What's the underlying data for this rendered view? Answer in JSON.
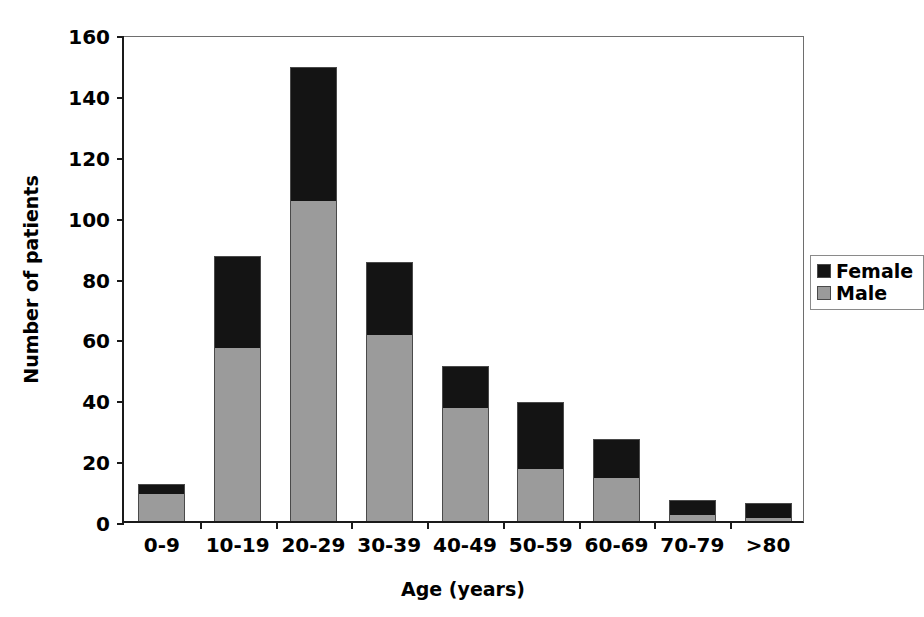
{
  "chart_data": {
    "type": "bar",
    "subtype": "stacked-vertical",
    "title": "",
    "xlabel": "Age (years)",
    "ylabel": "Number of patients",
    "categories": [
      "0-9",
      "10-19",
      "20-29",
      "30-39",
      "40-49",
      "50-59",
      "60-69",
      "70-79",
      ">80"
    ],
    "series": [
      {
        "name": "Male",
        "color": "#9b9b9b",
        "values": [
          9,
          57,
          105,
          61,
          37,
          17,
          14,
          2,
          1
        ]
      },
      {
        "name": "Female",
        "color": "#141414",
        "values": [
          3,
          30,
          44,
          24,
          14,
          22,
          13,
          5,
          5
        ]
      }
    ],
    "totals": [
      12,
      87,
      149,
      85,
      51,
      39,
      27,
      7,
      6
    ],
    "ylim": [
      0,
      160
    ],
    "yticks": [
      0,
      20,
      40,
      60,
      80,
      100,
      120,
      140,
      160
    ],
    "ytick_labels": [
      "0",
      "20",
      "40",
      "60",
      "80",
      "100",
      "120",
      "140",
      "160"
    ],
    "grid": false,
    "legend_position": "inside-upper-right",
    "legend_entries": [
      "Female",
      "Male"
    ]
  },
  "axes": {
    "y_title": "Number of patients",
    "x_title": "Age (years)"
  },
  "legend": {
    "female_label": "Female",
    "male_label": "Male"
  }
}
